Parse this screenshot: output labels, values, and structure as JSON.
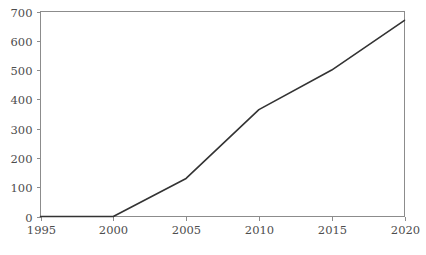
{
  "chart_data": {
    "type": "line",
    "title": "",
    "subtitle": "",
    "xlabel": "",
    "ylabel": "",
    "xlim": [
      1995,
      2020
    ],
    "ylim": [
      0,
      700
    ],
    "grid": false,
    "legend": false,
    "legend_position": "none",
    "line_color": "#333333",
    "axis_color": "#8c8c8c",
    "tick_label_color": "#4d4d4d",
    "x": [
      1995,
      2000,
      2005,
      2010,
      2015,
      2020
    ],
    "xticks": [
      1995,
      2000,
      2005,
      2010,
      2015,
      2020
    ],
    "xtick_labels": [
      "1995",
      "2000",
      "2005",
      "2010",
      "2015",
      "2020"
    ],
    "yticks": [
      0,
      100,
      200,
      300,
      400,
      500,
      600,
      700
    ],
    "ytick_labels": [
      "0",
      "100",
      "200",
      "300",
      "400",
      "500",
      "600",
      "700"
    ],
    "series": [
      {
        "name": "series-1",
        "values": [
          0,
          0,
          130,
          365,
          500,
          670
        ]
      }
    ],
    "annotations": []
  }
}
